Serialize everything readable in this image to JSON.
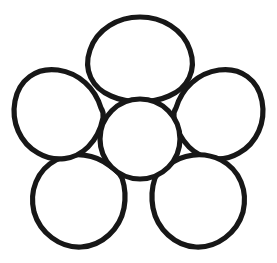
{
  "artwork": {
    "title": "Five-petal flower outline",
    "subject": "flower",
    "style": "black-and-white line art coloring-page outline",
    "background_color": "#ffffff",
    "stroke_color": "#171717",
    "fill_color": "#ffffff",
    "stroke_width": 5.2,
    "canvas": {
      "width": 277,
      "height": 263
    },
    "element_count": 6,
    "petal_count": 5,
    "center": {
      "name": "flower-center",
      "shape": "circle",
      "cx": 140,
      "cy": 139,
      "r": 40
    },
    "petals": [
      {
        "name": "petal-top",
        "position": "top",
        "shape": "rounded-teardrop",
        "cx": 140,
        "cy": 63,
        "rx": 51,
        "ry": 45,
        "angle_deg": 270
      },
      {
        "name": "petal-upper-right",
        "position": "upper-right",
        "shape": "rounded-teardrop",
        "cx": 212,
        "cy": 117,
        "rx": 49,
        "ry": 52,
        "angle_deg": 342
      },
      {
        "name": "petal-lower-right",
        "position": "lower-right",
        "shape": "rounded-teardrop",
        "cx": 185,
        "cy": 202,
        "rx": 52,
        "ry": 47,
        "angle_deg": 54
      },
      {
        "name": "petal-lower-left",
        "position": "lower-left",
        "shape": "rounded-teardrop",
        "cx": 96,
        "cy": 202,
        "rx": 52,
        "ry": 47,
        "angle_deg": 126
      },
      {
        "name": "petal-upper-left",
        "position": "upper-left",
        "shape": "rounded-teardrop",
        "cx": 69,
        "cy": 117,
        "rx": 49,
        "ry": 52,
        "angle_deg": 198
      }
    ]
  }
}
